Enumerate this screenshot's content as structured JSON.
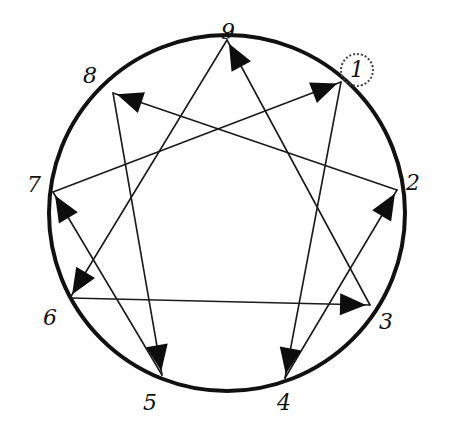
{
  "diagram": {
    "circle": {
      "cx": 227,
      "cy": 213,
      "r": 178,
      "stroke": "#111111",
      "stroke_width": 4
    },
    "points": [
      {
        "id": "9",
        "label": "9",
        "x": 227,
        "y": 40,
        "label_x": 228,
        "label_y": 32,
        "circled": false
      },
      {
        "id": "1",
        "label": "1",
        "x": 341,
        "y": 82,
        "label_x": 357,
        "label_y": 70,
        "circled": true
      },
      {
        "id": "2",
        "label": "2",
        "x": 397,
        "y": 190,
        "label_x": 413,
        "label_y": 183,
        "circled": false
      },
      {
        "id": "3",
        "label": "3",
        "x": 370,
        "y": 305,
        "label_x": 386,
        "label_y": 322,
        "circled": false
      },
      {
        "id": "4",
        "label": "4",
        "x": 285,
        "y": 378,
        "label_x": 284,
        "label_y": 403,
        "circled": false
      },
      {
        "id": "5",
        "label": "5",
        "x": 162,
        "y": 375,
        "label_x": 150,
        "label_y": 403,
        "circled": false
      },
      {
        "id": "6",
        "label": "6",
        "x": 70,
        "y": 298,
        "label_x": 50,
        "label_y": 318,
        "circled": false
      },
      {
        "id": "7",
        "label": "7",
        "x": 53,
        "y": 192,
        "label_x": 34,
        "label_y": 185,
        "circled": false
      },
      {
        "id": "8",
        "label": "8",
        "x": 113,
        "y": 93,
        "label_x": 90,
        "label_y": 76,
        "circled": false
      }
    ],
    "arrows": [
      {
        "from": "1",
        "to": "4"
      },
      {
        "from": "4",
        "to": "2"
      },
      {
        "from": "2",
        "to": "8"
      },
      {
        "from": "8",
        "to": "5"
      },
      {
        "from": "5",
        "to": "7"
      },
      {
        "from": "7",
        "to": "1"
      },
      {
        "from": "9",
        "to": "6"
      },
      {
        "from": "6",
        "to": "3"
      },
      {
        "from": "3",
        "to": "9"
      }
    ],
    "line_color": "#1a1a1a",
    "arrowhead_color": "#0d0d0d"
  }
}
